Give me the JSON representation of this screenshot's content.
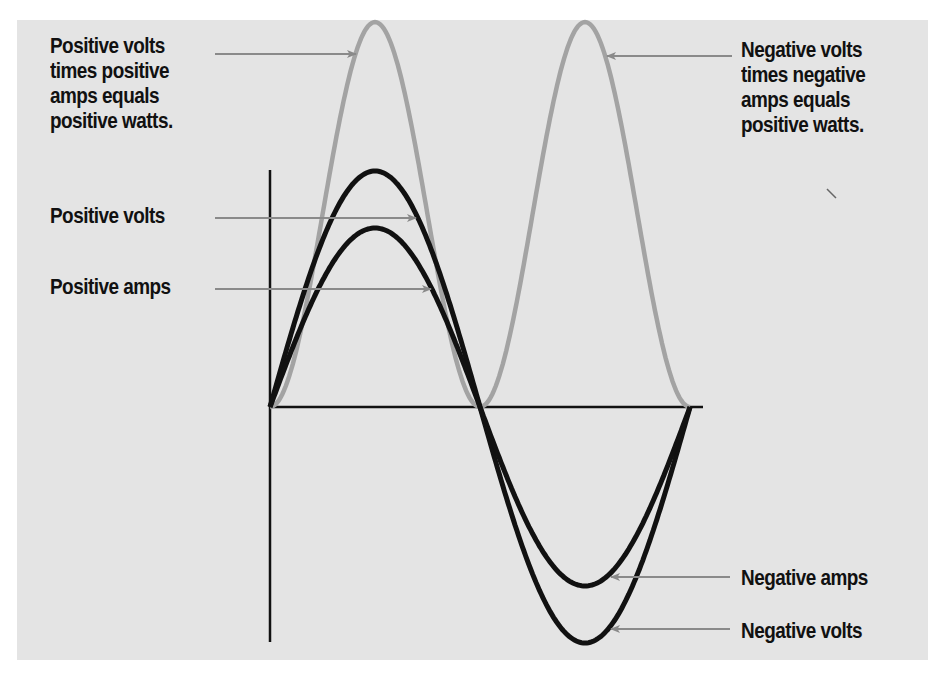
{
  "diagram": {
    "background_color": "#e4e4e4",
    "colors": {
      "volts_amps_curve": "#111111",
      "watts_curve": "#a3a3a3",
      "arrow": "#8a8a8a",
      "axis": "#111111",
      "text": "#111111"
    },
    "labels": {
      "positive_watts": {
        "lines": [
          "Positive volts",
          "times positive",
          "amps equals",
          "positive watts."
        ]
      },
      "positive_volts": {
        "lines": [
          "Positive volts"
        ]
      },
      "positive_amps": {
        "lines": [
          "Positive amps"
        ]
      },
      "negative_watts": {
        "lines": [
          "Negative volts",
          "times negative",
          "amps equals",
          "positive watts."
        ]
      },
      "negative_amps": {
        "lines": [
          "Negative amps"
        ]
      },
      "negative_volts": {
        "lines": [
          "Negative volts"
        ]
      }
    },
    "curves": [
      {
        "name": "volts",
        "type": "sine",
        "relative_amplitude": 1.0,
        "color": "#111111"
      },
      {
        "name": "amps",
        "type": "sine",
        "relative_amplitude": 0.76,
        "color": "#111111"
      },
      {
        "name": "watts",
        "type": "sine-squared (always positive)",
        "relative_amplitude": 1.63,
        "color": "#a3a3a3"
      }
    ]
  }
}
